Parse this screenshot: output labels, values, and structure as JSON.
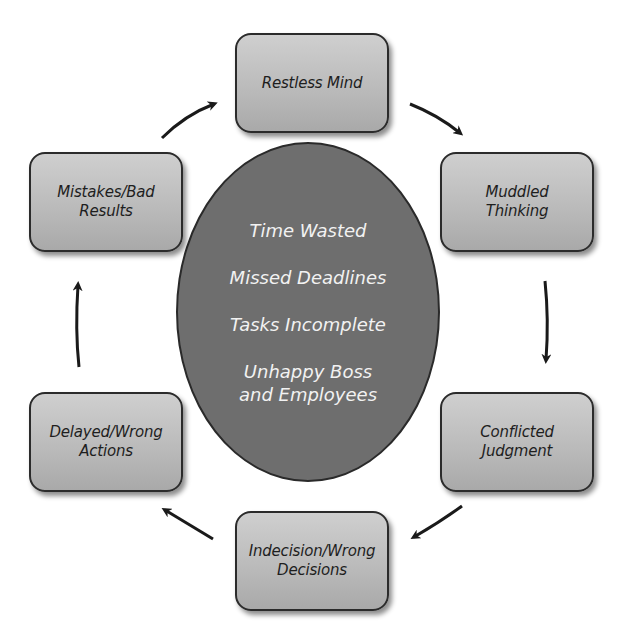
{
  "diagram": {
    "type": "cycle",
    "center": {
      "items": [
        "Time Wasted",
        "Missed Deadlines",
        "Tasks Incomplete",
        "Unhappy Boss\nand Employees"
      ]
    },
    "nodes": [
      {
        "id": "restless-mind",
        "label": "Restless Mind"
      },
      {
        "id": "muddled-thinking",
        "label": "Muddled\nThinking"
      },
      {
        "id": "conflicted-judgment",
        "label": "Conflicted\nJudgment"
      },
      {
        "id": "indecision-wrong-decisions",
        "label": "Indecision/Wrong\nDecisions"
      },
      {
        "id": "delayed-wrong-actions",
        "label": "Delayed/Wrong\nActions"
      },
      {
        "id": "mistakes-bad-results",
        "label": "Mistakes/Bad\nResults"
      }
    ],
    "edges": [
      {
        "from": "restless-mind",
        "to": "muddled-thinking"
      },
      {
        "from": "muddled-thinking",
        "to": "conflicted-judgment"
      },
      {
        "from": "conflicted-judgment",
        "to": "indecision-wrong-decisions"
      },
      {
        "from": "indecision-wrong-decisions",
        "to": "delayed-wrong-actions"
      },
      {
        "from": "delayed-wrong-actions",
        "to": "mistakes-bad-results"
      },
      {
        "from": "mistakes-bad-results",
        "to": "restless-mind"
      }
    ],
    "colors": {
      "box_fill": "#bdbdbd",
      "ellipse_fill": "#6e6e6e",
      "ellipse_text": "#f2f2f2",
      "arrow": "#1a1a1a"
    }
  }
}
